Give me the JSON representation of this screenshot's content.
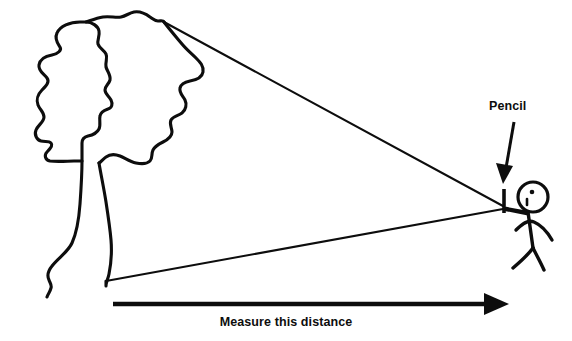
{
  "figure": {
    "background_color": "#ffffff",
    "ink_color": "#0d0d0d",
    "width": 572,
    "height": 341
  },
  "labels": {
    "pencil": "Pencil",
    "measure_distance": "Measure this distance"
  },
  "icons": {
    "tree": "tree-icon",
    "person": "stick-figure-icon",
    "pencil": "pencil-icon",
    "callout_arrow": "callout-arrow-icon",
    "measure_arrow": "measure-arrow-icon"
  },
  "elements": {
    "tree_crown_description": "hand-drawn irregular leafy crown outline",
    "tree_trunk_description": "two wavy vertical trunk lines",
    "sight_line_top": "line from tree top to pencil",
    "sight_line_bottom": "line from tree base to pencil",
    "person_description": "stick figure with round head, single eye dot, outstretched arm holding pencil, two legs"
  }
}
